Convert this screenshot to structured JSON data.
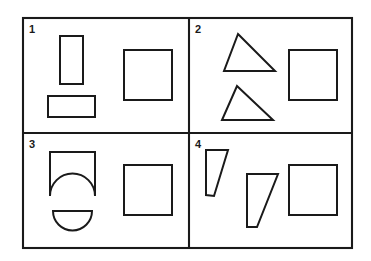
{
  "figure": {
    "background_color": "#ffffff",
    "line_color": "#1a1a1a",
    "outer_frame": {
      "x": 23,
      "y": 18,
      "width": 329,
      "height": 230
    },
    "divider_vertical_x": 189,
    "divider_horizontal_y": 133,
    "panels": [
      {
        "label": "1",
        "label_x": 29,
        "label_y": 33,
        "shape_names": [
          "vertical-rectangle",
          "horizontal-rectangle",
          "reference-square"
        ],
        "shapes": [
          {
            "name": "vertical-rectangle",
            "type": "rect",
            "x": 60,
            "y": 36,
            "width": 23,
            "height": 48
          },
          {
            "name": "horizontal-rectangle",
            "type": "rect",
            "x": 48,
            "y": 96,
            "width": 47,
            "height": 21
          },
          {
            "name": "reference-square",
            "type": "rect",
            "x": 124,
            "y": 50,
            "width": 48,
            "height": 50
          }
        ]
      },
      {
        "label": "2",
        "label_x": 195,
        "label_y": 33,
        "shape_names": [
          "triangle-upper",
          "triangle-lower",
          "reference-square"
        ],
        "shapes": [
          {
            "name": "triangle-upper",
            "type": "polygon",
            "points": "238,34 275,71 224,71"
          },
          {
            "name": "triangle-lower",
            "type": "polygon",
            "points": "237,86 273,120 222,120"
          },
          {
            "name": "reference-square",
            "type": "rect",
            "x": 289,
            "y": 50,
            "width": 48,
            "height": 50
          }
        ]
      },
      {
        "label": "3",
        "label_x": 29,
        "label_y": 148,
        "shape_names": [
          "square-with-arc-base",
          "semicircle",
          "reference-square"
        ],
        "shapes": [
          {
            "name": "square-with-arc-base",
            "type": "path",
            "d": "M 50 196 L 50 152 L 95 152 L 95 196 A 22.5 22.5 0 0 0 50 196"
          },
          {
            "name": "semicircle",
            "type": "path",
            "d": "M 53 211 L 92 211 A 19.5 19.5 0 0 1 53 211 Z"
          },
          {
            "name": "reference-square",
            "type": "rect",
            "x": 124,
            "y": 165,
            "width": 48,
            "height": 50
          }
        ]
      },
      {
        "label": "4",
        "label_x": 195,
        "label_y": 148,
        "shape_names": [
          "trapezoid-left",
          "trapezoid-right",
          "reference-square"
        ],
        "shapes": [
          {
            "name": "trapezoid-left",
            "type": "polygon",
            "points": "206,150 228,150 214,196 206,195"
          },
          {
            "name": "trapezoid-right",
            "type": "polygon",
            "points": "247,174 278,174 257,227 247,227"
          },
          {
            "name": "reference-square",
            "type": "rect",
            "x": 289,
            "y": 165,
            "width": 48,
            "height": 50
          }
        ]
      }
    ]
  }
}
